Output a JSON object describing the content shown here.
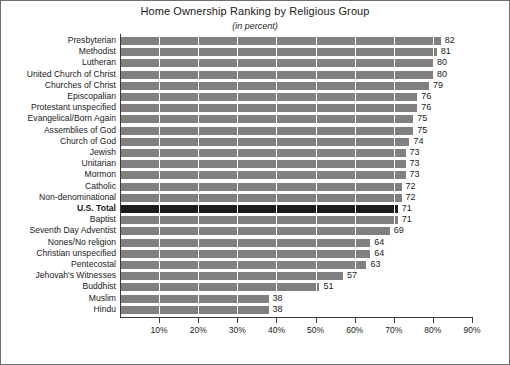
{
  "chart_data": {
    "type": "bar",
    "orientation": "horizontal",
    "title": "Home Ownership Ranking by Religious Group",
    "subtitle": "(in percent)",
    "xlabel": "",
    "ylabel": "",
    "xlim": [
      0,
      90
    ],
    "grid": "vertical",
    "legend": "none",
    "value_suffix": "",
    "highlight_category": "U.S. Total",
    "colors": {
      "bar": "#808080",
      "bar_highlight": "#1c1c1c",
      "gridline": "#ffffff",
      "axis": "#3a3a3a",
      "background": "#ffffff",
      "text": "#1a1a1a"
    },
    "xticks": [
      {
        "value": 10,
        "label": "10%"
      },
      {
        "value": 20,
        "label": "20%"
      },
      {
        "value": 30,
        "label": "30%"
      },
      {
        "value": 40,
        "label": "40%"
      },
      {
        "value": 50,
        "label": "50%"
      },
      {
        "value": 60,
        "label": "60%"
      },
      {
        "value": 70,
        "label": "70%"
      },
      {
        "value": 80,
        "label": "80%"
      },
      {
        "value": 90,
        "label": "90%"
      }
    ],
    "categories": [
      "Presbyterian",
      "Methodist",
      "Lutheran",
      "United Church of Christ",
      "Churches of Christ",
      "Episcopalian",
      "Protestant unspecified",
      "Evangelical/Born Again",
      "Assemblies of God",
      "Church of God",
      "Jewish",
      "Unitarian",
      "Mormon",
      "Catholic",
      "Non-denominational",
      "U.S. Total",
      "Baptist",
      "Seventh Day Adventist",
      "Nones/No religion",
      "Christian unspecified",
      "Pentecostal",
      "Jehovah's Witnesses",
      "Buddhist",
      "Muslim",
      "Hindu"
    ],
    "values": [
      82,
      81,
      80,
      80,
      79,
      76,
      76,
      75,
      75,
      74,
      73,
      73,
      73,
      72,
      72,
      71,
      71,
      69,
      64,
      64,
      63,
      57,
      51,
      38,
      38
    ]
  }
}
